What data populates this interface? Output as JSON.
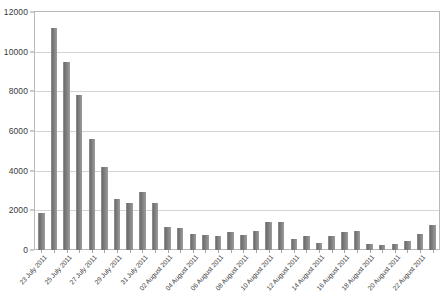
{
  "chart_data": {
    "type": "bar",
    "title": "",
    "subtitle": "",
    "xlabel": "",
    "ylabel": "",
    "ylim": [
      0,
      12000
    ],
    "ytick_step": 2000,
    "yticks": [
      0,
      2000,
      4000,
      6000,
      8000,
      10000,
      12000
    ],
    "ytick_labels": [
      "0",
      "2000",
      "4000",
      "6000",
      "8000",
      "10000",
      "12000"
    ],
    "grid": true,
    "grid_axis": "y",
    "legend": false,
    "legend_position": "none",
    "bar_color": "#7c7c7c",
    "categories": [
      "23 July 2011",
      "24 July 2011",
      "25 July 2011",
      "26 July 2011",
      "27 July 2011",
      "28 July 2011",
      "29 July 2011",
      "30 July 2011",
      "31 July 2011",
      "01 August 2011",
      "02 August 2011",
      "03 August 2011",
      "04 August 2011",
      "05 August 2011",
      "06 August 2011",
      "07 August 2011",
      "08 August 2011",
      "09 August 2011",
      "10 August 2011",
      "11 August 2011",
      "12 August 2011",
      "13 August 2011",
      "14 August 2011",
      "15 August 2011",
      "16 August 2011",
      "17 August 2011",
      "18 August 2011",
      "19 August 2011",
      "20 August 2011",
      "21 August 2011",
      "22 August 2011",
      "23 August 2011"
    ],
    "values": [
      1850,
      11200,
      9500,
      7800,
      5600,
      4200,
      2550,
      2350,
      2950,
      2350,
      1150,
      1100,
      800,
      750,
      700,
      900,
      750,
      950,
      1400,
      1400,
      550,
      700,
      350,
      700,
      900,
      950,
      300,
      250,
      300,
      450,
      800,
      1250
    ],
    "xtick_labels": [
      "23 July 2011",
      "25 July 2011",
      "27 July 2011",
      "29 July 2011",
      "31 July 2011",
      "02 August 2011",
      "04 August 2011",
      "06 August 2011",
      "08 August 2011",
      "10 August 2011",
      "12 August 2011",
      "14 August 2011",
      "16 August 2011",
      "18 August 2011",
      "20 August 2011",
      "22 August 2011"
    ],
    "xtick_indices": [
      0,
      2,
      4,
      6,
      8,
      10,
      12,
      14,
      16,
      18,
      20,
      22,
      24,
      26,
      28,
      30
    ]
  }
}
